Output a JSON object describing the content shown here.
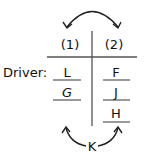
{
  "diagram": {
    "columns": [
      {
        "label": "(1)",
        "entries": [
          "L",
          "G"
        ]
      },
      {
        "label": "(2)",
        "entries": [
          "F",
          "J",
          "H"
        ]
      }
    ],
    "row_label": "Driver:",
    "bottom_label": "K",
    "top_arrow": "double-headed arc between column (1) and column (2)",
    "bottom_arrow": "arrows from K pointing to column (1) and column (2)",
    "colors": {
      "ink": "#111111",
      "line": "#555555",
      "background": "#ffffff"
    }
  }
}
